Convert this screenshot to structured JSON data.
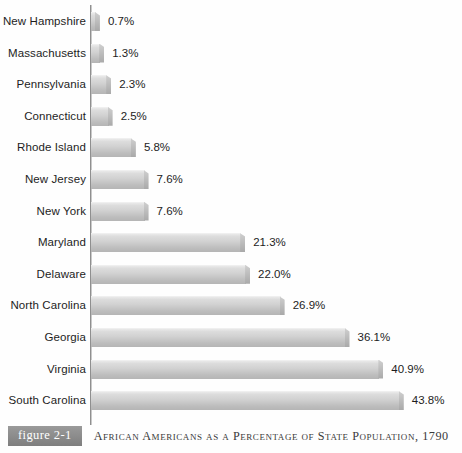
{
  "figure": {
    "badge_label": "figure 2-1",
    "caption": "African Americans as a Percentage of State Population, 1790"
  },
  "colors": {
    "bar_light": "#e9e9e9",
    "bar_dark": "#b5b5b5",
    "axis": "#8f8f8f",
    "badge": "#8a8a8a",
    "text": "#1d1d1d"
  },
  "chart_data": {
    "type": "bar",
    "orientation": "horizontal",
    "title": "African Americans as a Percentage of State Population, 1790",
    "xlabel": "",
    "ylabel": "",
    "xlim": [
      0,
      47
    ],
    "grid": false,
    "legend": false,
    "value_suffix": "%",
    "categories": [
      "New Hampshire",
      "Massachusetts",
      "Pennsylvania",
      "Connecticut",
      "Rhode Island",
      "New Jersey",
      "New York",
      "Maryland",
      "Delaware",
      "North Carolina",
      "Georgia",
      "Virginia",
      "South Carolina"
    ],
    "values": [
      0.7,
      1.3,
      2.3,
      2.5,
      5.8,
      7.6,
      7.6,
      21.3,
      22.0,
      26.9,
      36.1,
      40.9,
      43.8
    ],
    "value_labels": [
      "0.7%",
      "1.3%",
      "2.3%",
      "2.5%",
      "5.8%",
      "7.6%",
      "7.6%",
      "21.3%",
      "22.0%",
      "26.9%",
      "36.1%",
      "40.9%",
      "43.8%"
    ]
  }
}
